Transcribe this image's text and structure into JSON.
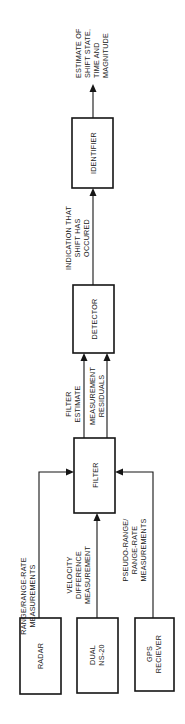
{
  "diagram": {
    "orientation": "rotated-90-ccw",
    "blocks": {
      "radar": {
        "label_lines": [
          "RADAR"
        ]
      },
      "dual": {
        "label_lines": [
          "DUAL",
          "NS-20"
        ]
      },
      "gps": {
        "label_lines": [
          "GPS",
          "RECIEVER"
        ]
      },
      "filter": {
        "label_lines": [
          "FILTER"
        ]
      },
      "detector": {
        "label_lines": [
          "DETECTOR"
        ]
      },
      "identifier": {
        "label_lines": [
          "IDENTIFIER"
        ]
      }
    },
    "edge_labels": {
      "radar_to_filter": [
        "RANGE/RANGE-RATE",
        "MEASUREMENTS"
      ],
      "dual_to_filter": [
        "VELOCITY",
        "DIFFERENCE",
        "MEASUREMENT"
      ],
      "gps_to_filter": [
        "PSEUDO-RANGE/",
        "RANGE-RATE",
        "MEASUREMENTS"
      ],
      "filter_estimate": [
        "FILTER",
        "ESTIMATE"
      ],
      "measurement_residuals": [
        "MEASUREMENT",
        "RESIDUALS"
      ],
      "detector_to_identifier": [
        "INDICATION THAT",
        "SHIFT HAS",
        "OCCURED"
      ],
      "identifier_output": [
        "ESTIMATE OF",
        "SHIFT STATE,",
        "TIME AND",
        "MAGNITUDE"
      ]
    }
  }
}
